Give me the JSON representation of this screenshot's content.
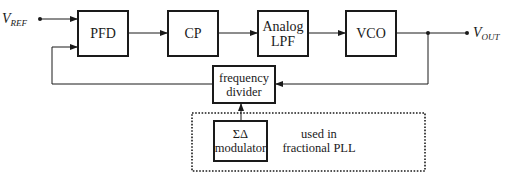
{
  "diagram": {
    "input": {
      "symbol": "V",
      "subscript": "REF"
    },
    "output": {
      "symbol": "V",
      "subscript": "OUT"
    },
    "blocks": [
      {
        "id": "pfd",
        "label": "PFD"
      },
      {
        "id": "cp",
        "label": "CP"
      },
      {
        "id": "lpf",
        "line1": "Analog",
        "line2": "LPF"
      },
      {
        "id": "vco",
        "label": "VCO"
      },
      {
        "id": "divider",
        "line1": "frequency",
        "line2": "divider"
      },
      {
        "id": "sdm",
        "line1": "ΣΔ",
        "line2": "modulator"
      }
    ],
    "annotation": {
      "line1": "used in",
      "line2": "fractional PLL"
    },
    "edges": [
      {
        "from": "V_REF",
        "to": "pfd"
      },
      {
        "from": "pfd",
        "to": "cp"
      },
      {
        "from": "cp",
        "to": "lpf"
      },
      {
        "from": "lpf",
        "to": "vco"
      },
      {
        "from": "vco",
        "to": "V_OUT"
      },
      {
        "from": "vco",
        "to": "divider"
      },
      {
        "from": "divider",
        "to": "pfd"
      },
      {
        "from": "sdm",
        "to": "divider"
      }
    ]
  }
}
